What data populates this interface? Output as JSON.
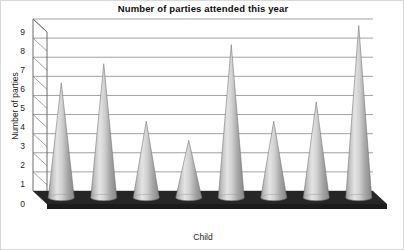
{
  "chart_data": {
    "type": "bar",
    "title": "Number of parties attended this year",
    "xlabel": "Child",
    "ylabel": "Number of parties",
    "categories": [
      "Grace",
      "Abbey",
      "William",
      "Rose",
      "Jan",
      "Javid",
      "Susan",
      "Alice"
    ],
    "values": [
      6,
      7,
      4,
      3,
      8,
      4,
      5,
      9
    ],
    "data_labels": [
      "6",
      "7",
      "4",
      "3",
      "8",
      "4",
      "5",
      "9"
    ],
    "ylim": [
      0,
      9
    ],
    "yticks": [
      "0",
      "1",
      "2",
      "3",
      "4",
      "5",
      "6",
      "7",
      "8",
      "9"
    ],
    "grid": true,
    "legend": "none",
    "style": {
      "marker_shape": "cone",
      "three_d": true,
      "bar_fill_light": "#e8e8e8",
      "bar_fill_mid": "#b9b9b9",
      "bar_fill_dark": "#8e8e8e",
      "bar_outline": "#6f6f6f",
      "floor_color": "#262626",
      "gridline_color": "#8a8a8a",
      "axis_color": "#6a6a6a",
      "background": "#ffffff",
      "text_color": "#1a1a1a"
    }
  }
}
